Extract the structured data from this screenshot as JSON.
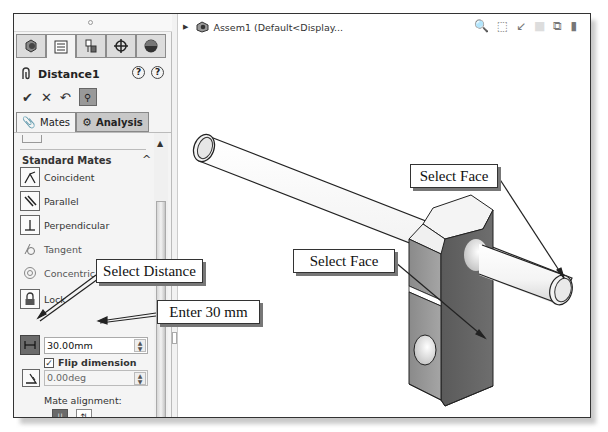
{
  "property_manager": {
    "tabs": [
      {
        "icon": "feature-manager-icon",
        "active": false
      },
      {
        "icon": "property-manager-icon",
        "active": true
      },
      {
        "icon": "configuration-manager-icon",
        "active": false
      },
      {
        "icon": "dimxpert-manager-icon",
        "active": false
      },
      {
        "icon": "display-manager-icon",
        "active": false
      }
    ],
    "title": "Distance1",
    "help_icons": [
      "?",
      "?"
    ],
    "actions": {
      "ok": "✔",
      "cancel": "✕",
      "undo": "↶",
      "pin": "⚲"
    },
    "subtabs": [
      {
        "label": "Mates",
        "icon": "mates-icon",
        "active": true
      },
      {
        "label": "Analysis",
        "icon": "analysis-icon",
        "active": false
      }
    ],
    "section": {
      "title": "Standard Mates",
      "chevron": "^",
      "items": [
        {
          "label": "Coincident",
          "icon": "coincident-icon"
        },
        {
          "label": "Parallel",
          "icon": "parallel-icon"
        },
        {
          "label": "Perpendicular",
          "icon": "perpendicular-icon"
        },
        {
          "label": "Tangent",
          "icon": "tangent-icon"
        },
        {
          "label": "Concentric",
          "icon": "concentric-icon"
        },
        {
          "label": "Lock",
          "icon": "lock-icon"
        }
      ],
      "distance": {
        "value": "30.00mm",
        "icon": "distance-icon",
        "selected": true
      },
      "flip_dimension": {
        "label": "Flip dimension",
        "checked": true
      },
      "angle": {
        "value": "0.00deg",
        "icon": "angle-icon"
      },
      "mate_alignment": {
        "label": "Mate alignment:",
        "options": [
          "aligned",
          "anti-aligned"
        ],
        "selected": "aligned"
      }
    }
  },
  "viewport": {
    "tree_label": "Assem1  (Default<Display...",
    "headsup_icons": [
      "zoom-to-fit-icon",
      "zoom-to-area-icon",
      "previous-view-icon",
      "section-view-icon",
      "view-orientation-icon",
      "display-style-icon"
    ]
  },
  "callouts": {
    "select_face_top": "Select Face",
    "select_face_mid": "Select Face",
    "select_distance": "Select Distance",
    "enter_distance": "Enter 30 mm"
  },
  "colors": {
    "panel_bg": "#f4f4f4",
    "tab_inactive": "#dcdcdc",
    "selected_button": "#6b6b6b",
    "block_front": "#8e8e8e",
    "block_side": "#5c5c5c",
    "block_top": "#f2f2f2"
  }
}
